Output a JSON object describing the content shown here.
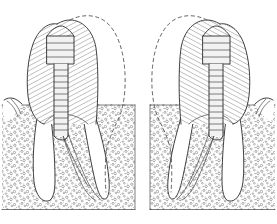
{
  "figure": {
    "title": "Endodontically treated molars with intraradicular posts",
    "background_color": "#ffffff",
    "ink_color": "#2b2b2b",
    "hatch_color": "#4a4a4a",
    "dash_color": "#5a5a5a",
    "width": 277,
    "height": 224,
    "panel_count": 2,
    "style": "line-art-diagram"
  },
  "panels": [
    {
      "id": "left-panel",
      "label": "Left molar — mesial half restored",
      "orientation": "hatched-crown-left",
      "crown": {
        "label": "Hatched crown (restoration)",
        "fill_pattern": "diagonal-hatch",
        "hatch_angle_deg": 62,
        "hatch_spacing_px": 4.2
      },
      "phantom_outline": {
        "label": "Dashed phantom crown outline (missing structure)",
        "stroke": "dashed"
      },
      "post": {
        "label": "Intraradicular threaded post",
        "head_bands": 4,
        "shaft_threads": 11,
        "head_width_px": 22,
        "shaft_width_px": 9
      },
      "roots": {
        "label": "Two root canals",
        "count": 2
      },
      "bone": {
        "label": "Alveolar bone (stippled)",
        "texture": "stipple",
        "top_y": 104,
        "bottom_y": 210
      }
    },
    {
      "id": "right-panel",
      "label": "Right molar — distal half restored (mirrored)",
      "orientation": "hatched-crown-right",
      "crown": {
        "label": "Hatched crown (restoration)",
        "fill_pattern": "diagonal-hatch",
        "hatch_angle_deg": -62,
        "hatch_spacing_px": 4.2
      },
      "phantom_outline": {
        "label": "Dashed phantom crown outline (missing structure)",
        "stroke": "dashed"
      },
      "post": {
        "label": "Intraradicular threaded post",
        "head_bands": 4,
        "shaft_threads": 11,
        "head_width_px": 22,
        "shaft_width_px": 9
      },
      "roots": {
        "label": "Two root canals",
        "count": 2
      },
      "bone": {
        "label": "Alveolar bone (stippled)",
        "texture": "stipple",
        "top_y": 104,
        "bottom_y": 210
      }
    }
  ]
}
